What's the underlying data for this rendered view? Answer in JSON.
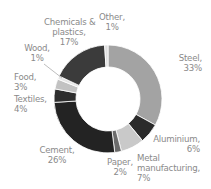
{
  "chart_data": {
    "type": "pie",
    "donut": true,
    "title": "",
    "start_angle_deg": 0,
    "direction": "clockwise",
    "categories": [
      "Steel",
      "Aluminium",
      "Metal manufacturing",
      "Paper",
      "Cement",
      "Textiles",
      "Food",
      "Wood",
      "Chemicals & plastics",
      "Other"
    ],
    "values": [
      33,
      6,
      7,
      2,
      26,
      4,
      3,
      1,
      17,
      1
    ],
    "unit": "%",
    "colors": [
      "#a3a3a3",
      "#2b2b2b",
      "#c9c9c9",
      "#6b6b6b",
      "#232323",
      "#2e2e2e",
      "#c2c2c2",
      "#e6e6e6",
      "#3b3b3b",
      "#dedede"
    ],
    "legend": "none (inline labels)",
    "labels": [
      {
        "name": "Steel,",
        "value": "33%"
      },
      {
        "name": "Aluminium,",
        "value": "6%"
      },
      {
        "name": "Metal",
        "name2": "manufacturing,",
        "value": "7%"
      },
      {
        "name": "Paper,",
        "value": "2%"
      },
      {
        "name": "Cement,",
        "value": "26%"
      },
      {
        "name": "Textiles,",
        "value": "4%"
      },
      {
        "name": "Food,",
        "value": "3%"
      },
      {
        "name": "Wood,",
        "value": "1%"
      },
      {
        "name": "Chemicals &",
        "name2": "plastics,",
        "value": "17%"
      },
      {
        "name": "Other,",
        "value": "1%"
      }
    ]
  }
}
